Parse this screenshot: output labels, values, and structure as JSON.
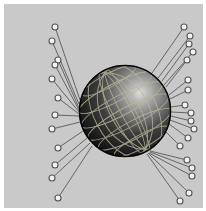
{
  "illustration": {
    "subject": "globe with radiating connector lines",
    "colors": {
      "background": "#ffffff",
      "panel": "#c9c9c9",
      "line": "#4a4a4a",
      "node_fill": "#f2f2f2",
      "node_stroke": "#555555",
      "globe_dark": "#0e0e0e",
      "globe_mid": "#4a4a4a",
      "globe_highlight": "#d8d8d8",
      "grid": "#b9b59a"
    },
    "globe": {
      "cx": 125,
      "cy": 111,
      "r": 46
    },
    "connectors": [
      {
        "x": 55,
        "y": 27,
        "ax": 80,
        "ay": 100
      },
      {
        "x": 52,
        "y": 41,
        "ax": 79,
        "ay": 104
      },
      {
        "x": 58,
        "y": 60,
        "ax": 79,
        "ay": 108
      },
      {
        "x": 55,
        "y": 65,
        "ax": 79,
        "ay": 110
      },
      {
        "x": 52,
        "y": 79,
        "ax": 79,
        "ay": 112
      },
      {
        "x": 58,
        "y": 98,
        "ax": 79,
        "ay": 114
      },
      {
        "x": 55,
        "y": 115,
        "ax": 79,
        "ay": 116
      },
      {
        "x": 52,
        "y": 129,
        "ax": 80,
        "ay": 122
      },
      {
        "x": 58,
        "y": 148,
        "ax": 83,
        "ay": 131
      },
      {
        "x": 55,
        "y": 165,
        "ax": 87,
        "ay": 138
      },
      {
        "x": 52,
        "y": 178,
        "ax": 90,
        "ay": 143
      },
      {
        "x": 58,
        "y": 198,
        "ax": 92,
        "ay": 146
      },
      {
        "x": 184,
        "y": 27,
        "ax": 152,
        "ay": 73
      },
      {
        "x": 190,
        "y": 36,
        "ax": 158,
        "ay": 78
      },
      {
        "x": 189,
        "y": 44,
        "ax": 162,
        "ay": 81
      },
      {
        "x": 193,
        "y": 52,
        "ax": 164,
        "ay": 85
      },
      {
        "x": 187,
        "y": 60,
        "ax": 166,
        "ay": 87
      },
      {
        "x": 188,
        "y": 80,
        "ax": 169,
        "ay": 95
      },
      {
        "x": 188,
        "y": 90,
        "ax": 170,
        "ay": 99
      },
      {
        "x": 185,
        "y": 105,
        "ax": 171,
        "ay": 107
      },
      {
        "x": 191,
        "y": 113,
        "ax": 171,
        "ay": 112
      },
      {
        "x": 191,
        "y": 121,
        "ax": 171,
        "ay": 116
      },
      {
        "x": 194,
        "y": 129,
        "ax": 170,
        "ay": 120
      },
      {
        "x": 188,
        "y": 138,
        "ax": 169,
        "ay": 124
      },
      {
        "x": 180,
        "y": 146,
        "ax": 166,
        "ay": 132
      },
      {
        "x": 187,
        "y": 160,
        "ax": 150,
        "ay": 151
      },
      {
        "x": 192,
        "y": 168,
        "ax": 150,
        "ay": 152
      },
      {
        "x": 192,
        "y": 176,
        "ax": 149,
        "ay": 153
      },
      {
        "x": 189,
        "y": 193,
        "ax": 148,
        "ay": 153
      },
      {
        "x": 180,
        "y": 201,
        "ax": 147,
        "ay": 154
      }
    ],
    "node_radius": 3
  }
}
